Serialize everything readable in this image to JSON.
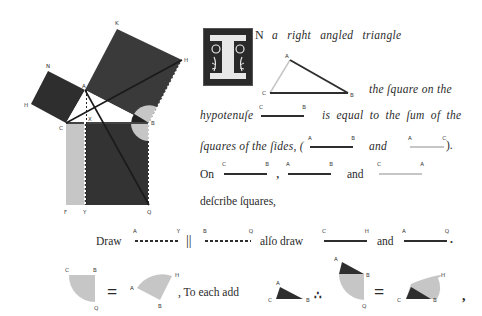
{
  "figure": {
    "point_labels": {
      "K": "K",
      "H": "H",
      "N": "N",
      "H2": "H",
      "A": "A",
      "C": "C",
      "X": "X",
      "B": "B",
      "F": "F",
      "Y": "Y",
      "Q": "Q"
    },
    "colors": {
      "dark": "#2e2e2e",
      "medium_dark": "#3a3a3a",
      "light": "#c6c6c6",
      "white": "#ffffff"
    }
  },
  "text": {
    "initial_letter": "I",
    "line1": "N a right angled triangle",
    "line2": "the ſquare on the",
    "line3a": "hypotenuſe",
    "line3b": "is equal to the ſum of the",
    "line4a": "ſquares of the ſides, (",
    "line4b": "and",
    "line4c": ").",
    "line5a": "On",
    "line5b": ",",
    "line5c": "and",
    "line6": "deſcribe ſquares,",
    "line7a": "Draw",
    "line7b": "||",
    "line7c": "alſo draw",
    "line7d": "and",
    "line7e": ".",
    "line8a": "=",
    "line8b": ", To each add",
    "line8c": "∴",
    "line8d": "=",
    "line8e": ","
  },
  "segments": {
    "hyp_CB": {
      "a": "C",
      "b": "B"
    },
    "side_AB": {
      "a": "A",
      "b": "B"
    },
    "side_AC": {
      "a": "A",
      "b": "C"
    },
    "on_CB": {
      "a": "C",
      "b": "B"
    },
    "on_AB": {
      "a": "A",
      "b": "B"
    },
    "on_CA": {
      "a": "C",
      "b": "A"
    },
    "draw_AY": {
      "a": "A",
      "b": "Y"
    },
    "draw_BQ": {
      "a": "B",
      "b": "Q"
    },
    "draw_CH": {
      "a": "C",
      "b": "H"
    },
    "draw_AQ": {
      "a": "A",
      "b": "Q"
    }
  },
  "triangle_labels": {
    "A": "A",
    "B": "B",
    "C": "C"
  },
  "angle_labels": {
    "g1": {
      "C": "C",
      "B": "B",
      "Q": "Q"
    },
    "g2": {
      "A": "A",
      "H": "H",
      "B": "B"
    },
    "g3": {
      "A": "A",
      "C": "C",
      "B": "B"
    },
    "g4": {
      "A": "A",
      "B": "B",
      "Q": "Q"
    },
    "g5": {
      "C": "C",
      "B": "B",
      "H": "H"
    }
  }
}
